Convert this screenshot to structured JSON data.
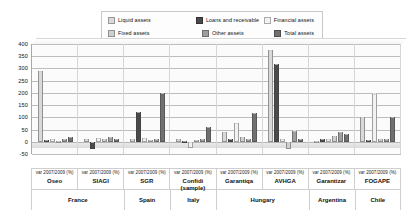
{
  "chart_data": {
    "type": "bar",
    "title": "",
    "subtitle": "",
    "xlabel": "",
    "ylabel": "",
    "ylim": [
      -50,
      400
    ],
    "ytick_step": 50,
    "yticks": [
      "400",
      "350",
      "300",
      "250",
      "200",
      "150",
      "100",
      "50",
      "0",
      "-50"
    ],
    "grid": true,
    "legend_position": "top-center",
    "value_axis_note": "var 2007/2009 (%)",
    "categories": [
      "Oseo",
      "SIAGI",
      "SGR",
      "Confidi (sample)",
      "Garantiqa",
      "AVHGA",
      "Garantizar",
      "FOGAPE"
    ],
    "category_sublabels": [
      "var 2007/2009 (%)",
      "var 2007/2009 (%)",
      "var 2007/2009 (%)",
      "var 2007/2009 (%)",
      "var 2007/2009 (%)",
      "var 2007/2009 (%)",
      "var 2007/2009 (%)",
      "var 2007/2009 (%)"
    ],
    "countries": [
      {
        "name": "France",
        "span": 2
      },
      {
        "name": "Spain",
        "span": 1
      },
      {
        "name": "Italy",
        "span": 1
      },
      {
        "name": "Hungary",
        "span": 2
      },
      {
        "name": "Argentina",
        "span": 1
      },
      {
        "name": "Chile",
        "span": 1
      }
    ],
    "series": [
      {
        "name": "Liquid assets",
        "color": "#d9d9d9",
        "values": [
          290,
          10,
          12,
          10,
          40,
          375,
          5,
          100
        ]
      },
      {
        "name": "Loans and receivable",
        "color": "#4a4a4a",
        "values": [
          8,
          -30,
          120,
          5,
          12,
          320,
          10,
          8
        ]
      },
      {
        "name": "Financial assets",
        "color": "#f2f2f2",
        "values": [
          10,
          15,
          15,
          -25,
          75,
          10,
          12,
          195
        ]
      },
      {
        "name": "Fixed assets",
        "color": "#cfcfcf",
        "values": [
          5,
          10,
          8,
          8,
          18,
          -28,
          25,
          10
        ]
      },
      {
        "name": "Other assets",
        "color": "#9e9e9e",
        "values": [
          12,
          18,
          10,
          12,
          10,
          45,
          38,
          12
        ]
      },
      {
        "name": "Total assets",
        "color": "#707070",
        "values": [
          18,
          12,
          200,
          60,
          118,
          12,
          30,
          100
        ]
      }
    ]
  }
}
